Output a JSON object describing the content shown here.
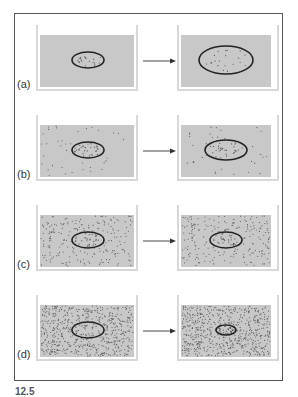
{
  "figure": {
    "caption_fragment": "12.5",
    "panels": [
      {
        "id": "a",
        "label": "(a)",
        "outside_density": 0,
        "inside_density": 20,
        "before": {
          "rx": 16,
          "ry": 8
        },
        "after": {
          "rx": 27,
          "ry": 14
        },
        "outcome": "cell swells"
      },
      {
        "id": "b",
        "label": "(b)",
        "outside_density": 40,
        "inside_density": 30,
        "before": {
          "rx": 16,
          "ry": 8
        },
        "after": {
          "rx": 21,
          "ry": 10
        },
        "outcome": "cell swells slightly"
      },
      {
        "id": "c",
        "label": "(c)",
        "outside_density": 220,
        "inside_density": 30,
        "before": {
          "rx": 16,
          "ry": 8
        },
        "after": {
          "rx": 16,
          "ry": 8
        },
        "outcome": "no change"
      },
      {
        "id": "d",
        "label": "(d)",
        "outside_density": 600,
        "inside_density": 30,
        "before": {
          "rx": 16,
          "ry": 8
        },
        "after": {
          "rx": 10,
          "ry": 5
        },
        "outcome": "cell shrinks"
      }
    ],
    "colors": {
      "fill": "#c8c8c8",
      "wall": "#d8d8d8",
      "outline": "#222222",
      "dot": "#555555",
      "arrow": "#333333"
    }
  }
}
